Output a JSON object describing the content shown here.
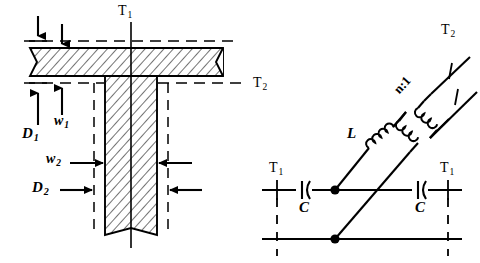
{
  "figure": {
    "background": "#ffffff",
    "ink": "#000000",
    "panels": [
      "physical-t-junction-cross-section",
      "equivalent-lumped-circuit"
    ]
  },
  "left_panel": {
    "name": "t-junction-cross-section",
    "labels": {
      "t1": "T",
      "t1_sub": "1",
      "t2": "T",
      "t2_sub": "2",
      "d1": "D",
      "d1_sub": "1",
      "w1": "w",
      "w1_sub": "1",
      "d2": "D",
      "d2_sub": "2",
      "w2": "w",
      "w2_sub": "2"
    },
    "dimension_arrows": [
      {
        "name": "d1-top-arrow",
        "direction": "down",
        "x": 38
      },
      {
        "name": "w1-top-arrow",
        "direction": "down",
        "x": 62
      },
      {
        "name": "d1-bottom-arrow",
        "direction": "up",
        "x": 38
      },
      {
        "name": "w1-bottom-arrow",
        "direction": "up",
        "x": 62
      },
      {
        "name": "w2-left-arrow",
        "direction": "right",
        "y": 163
      },
      {
        "name": "w2-right-arrow",
        "direction": "left",
        "y": 163
      },
      {
        "name": "d2-left-arrow",
        "direction": "right",
        "y": 190
      },
      {
        "name": "d2-right-arrow",
        "direction": "left",
        "y": 190
      }
    ],
    "reference_planes": [
      "T1 vertical centerline",
      "T2 horizontal dashed plane"
    ]
  },
  "right_panel": {
    "name": "equivalent-circuit",
    "labels": {
      "t1_left": "T",
      "t1_left_sub": "1",
      "t1_right": "T",
      "t1_right_sub": "1",
      "t2": "T",
      "t2_sub": "2",
      "inductor": "L",
      "capacitor_left": "C",
      "capacitor_right": "C",
      "turns_ratio": "n:1"
    },
    "components": [
      {
        "name": "series-capacitor-left",
        "symbol": "C",
        "type": "capacitor"
      },
      {
        "name": "series-capacitor-right",
        "symbol": "C",
        "type": "capacitor"
      },
      {
        "name": "shunt-inductor",
        "symbol": "L",
        "type": "inductor"
      },
      {
        "name": "ideal-transformer",
        "symbol": "n:1",
        "type": "transformer"
      }
    ],
    "nodes": [
      {
        "name": "junction-node-top",
        "x": 335,
        "y": 190
      },
      {
        "name": "junction-node-bottom",
        "x": 335,
        "y": 239
      }
    ]
  }
}
